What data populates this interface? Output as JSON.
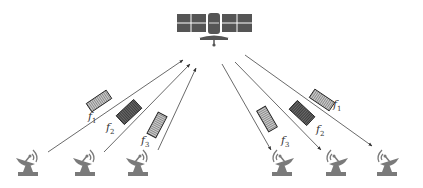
{
  "diagram": {
    "title": "",
    "colors": {
      "satellite": "#555555",
      "panel_lines": "#ffffff",
      "link": "#444444",
      "station": "#7a7a7a",
      "band_light": "#b5b5b5",
      "band_dark": "#5e5e5e"
    },
    "satellite": {
      "name": "satellite-icon",
      "x": 214,
      "y": 26
    },
    "uplink_group": {
      "direction": "uplink",
      "links": [
        {
          "label": "f",
          "sub": "1",
          "from": [
            48,
            152
          ],
          "to": [
            183,
            60
          ]
        },
        {
          "label": "f",
          "sub": "2",
          "from": [
            104,
            152
          ],
          "to": [
            190,
            64
          ]
        },
        {
          "label": "f",
          "sub": "3",
          "from": [
            158,
            150
          ],
          "to": [
            196,
            68
          ]
        }
      ]
    },
    "downlink_group": {
      "direction": "downlink",
      "links": [
        {
          "label": "f",
          "sub": "3",
          "from": [
            222,
            64
          ],
          "to": [
            271,
            150
          ]
        },
        {
          "label": "f",
          "sub": "2",
          "from": [
            235,
            62
          ],
          "to": [
            321,
            150
          ]
        },
        {
          "label": "f",
          "sub": "1",
          "from": [
            245,
            55
          ],
          "to": [
            372,
            146
          ]
        }
      ]
    },
    "ground_stations": [
      {
        "name": "ground-station-1",
        "x": 27
      },
      {
        "name": "ground-station-2",
        "x": 84
      },
      {
        "name": "ground-station-3",
        "x": 137
      },
      {
        "name": "ground-station-4",
        "x": 283
      },
      {
        "name": "ground-station-5",
        "x": 337
      },
      {
        "name": "ground-station-6",
        "x": 388
      }
    ],
    "labels": {
      "up_f1": "f",
      "up_f1_sub": "1",
      "up_f2": "f",
      "up_f2_sub": "2",
      "up_f3": "f",
      "up_f3_sub": "3",
      "down_f1": "f",
      "down_f1_sub": "1",
      "down_f2": "f",
      "down_f2_sub": "2",
      "down_f3": "f",
      "down_f3_sub": "3"
    }
  }
}
